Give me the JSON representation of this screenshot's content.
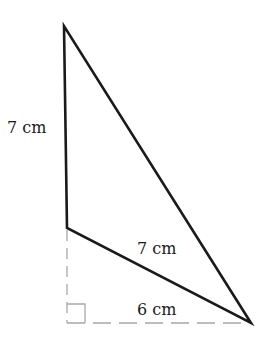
{
  "diagram": {
    "type": "geometry-figure",
    "vertices": {
      "top": {
        "x": 64,
        "y": 26
      },
      "bottom_left": {
        "x": 67,
        "y": 228
      },
      "right": {
        "x": 251,
        "y": 323
      },
      "foot": {
        "x": 67,
        "y": 323
      }
    },
    "labels": {
      "left_side": "7 cm",
      "lower_side": "7 cm",
      "base_extension": "6 cm"
    },
    "colors": {
      "solid_line": "#1a1a1a",
      "dashed_line": "#a8a8a8",
      "background": "#ffffff"
    },
    "right_angle_marker": {
      "x": 67,
      "y": 304,
      "size": 18
    }
  }
}
